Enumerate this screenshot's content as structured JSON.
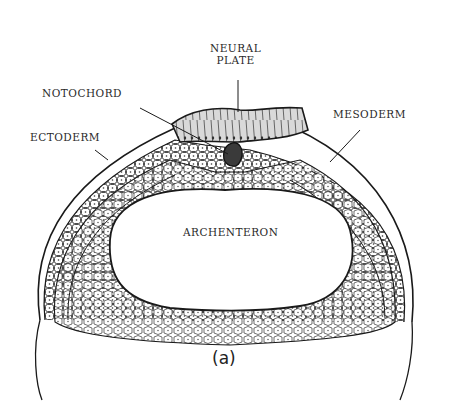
{
  "figure": {
    "caption": "(a)",
    "colors": {
      "outline": "#1a1a1a",
      "cell_fill": "#ffffff",
      "neural_plate_fill": "#d9d9d9",
      "notochord_fill": "#3a3a3a",
      "background": "#ffffff"
    },
    "labels": {
      "neural_plate_line1": "NEURAL",
      "neural_plate_line2": "PLATE",
      "notochord": "NOTOCHORD",
      "ectoderm": "ECTODERM",
      "mesoderm": "MESODERM",
      "archenteron": "ARCHENTERON"
    }
  }
}
